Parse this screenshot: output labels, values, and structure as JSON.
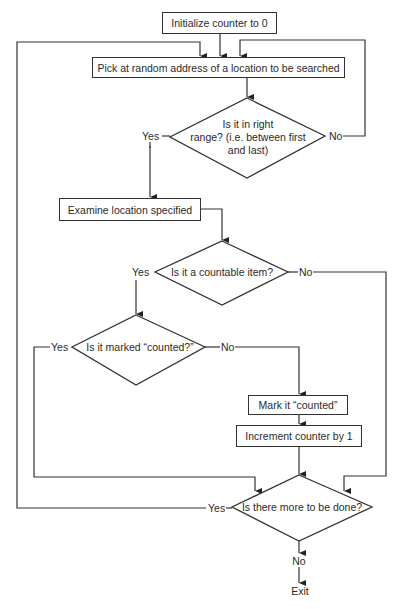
{
  "flowchart": {
    "start": "Initialize counter to 0",
    "pick": "Pick at random address of a location to be searched",
    "range_check": {
      "line1": "Is it in right",
      "line2": "range?  (i.e. between first",
      "line3": "and last)",
      "yes": "Yes",
      "no": "No"
    },
    "examine": "Examine location specified",
    "countable": {
      "text": "Is it a countable item?",
      "yes": "Yes",
      "no": "No"
    },
    "marked": {
      "text": "Is it marked “counted?”",
      "yes": "Yes",
      "no": "No"
    },
    "mark": "Mark it “counted”",
    "increment": "Increment counter by 1",
    "more": {
      "text": "Is there more to be done?",
      "yes": "Yes",
      "no": "No"
    },
    "exit": "Exit"
  }
}
